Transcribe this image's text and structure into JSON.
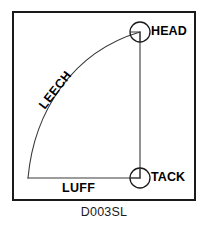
{
  "diagram": {
    "title_caption": "D003SL",
    "type": "sail-plan-diagram",
    "frame": {
      "x": 12,
      "y": 11,
      "width": 184,
      "height": 190,
      "stroke_color": "#1a1a1a",
      "stroke_width": 2,
      "fill_color": "#ffffff"
    },
    "edges": [
      {
        "name": "leech",
        "label": "LEECH",
        "shape": "curve",
        "from": "clew",
        "to": "head",
        "label_rotation_deg": -52
      },
      {
        "name": "luff",
        "label": "LUFF",
        "shape": "line",
        "from": "clew",
        "to": "tack"
      },
      {
        "name": "foot",
        "label": "",
        "shape": "line",
        "from": "tack",
        "to": "head"
      }
    ],
    "corners": [
      {
        "name": "head",
        "label": "HEAD",
        "marker": "circle",
        "cx": 140,
        "cy": 32,
        "r": 10
      },
      {
        "name": "tack",
        "label": "TACK",
        "marker": "circle",
        "cx": 140,
        "cy": 178,
        "r": 10
      },
      {
        "name": "clew",
        "label": "",
        "marker": "none",
        "cx": 28,
        "cy": 178,
        "r": 0
      }
    ],
    "geometry": {
      "leech_path": "M 28 178 C 34 112 72 52 140 32",
      "luff_path": "M 140 32 L 140 178",
      "foot_path": "M 28 178 L 140 178",
      "head_notch_path": "M 130 32 L 140 32 L 140 42",
      "tack_notch_path": "M 130 178 L 140 178 L 140 168"
    },
    "colors": {
      "line": "#3a3a3a",
      "frame": "#1a1a1a",
      "text": "#000000",
      "background": "#ffffff"
    }
  }
}
